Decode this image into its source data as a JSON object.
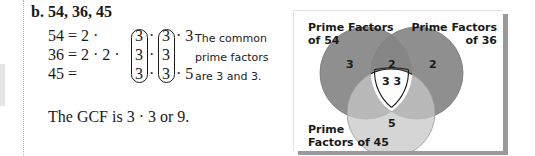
{
  "example": {
    "heading": "b. 54, 36, 45",
    "equations": [
      {
        "lhs": "54 = 2 ·",
        "factors": [
          "3",
          "3",
          "3"
        ],
        "tail": "· 3"
      },
      {
        "lhs": "36 = 2 · 2 ·",
        "factors": [
          "3",
          "3"
        ],
        "tail": ""
      },
      {
        "lhs": "45 =",
        "factors": [
          "3",
          "3"
        ],
        "tail": "· 5"
      }
    ],
    "dot": "·",
    "note_lines": [
      "The common",
      "prime factors",
      "are 3 and 3."
    ],
    "conclusion": "The GCF is 3 · 3 or 9."
  },
  "venn": {
    "labels": {
      "set_a_line1": "Prime Factors",
      "set_a_line2": "of 54",
      "set_b_line1": "Prime Factors",
      "set_b_line2": "of 36",
      "set_c_line1": "Prime",
      "set_c_line2": "Factors of 45"
    },
    "regions": {
      "a_only": "3",
      "b_only": "2",
      "a_and_b_only": "2",
      "all_three": "3 3",
      "c_only": "5"
    },
    "colors": {
      "circle_a": "#8f8f8f",
      "circle_b": "#8f8f8f",
      "circle_c": "#c7c7c7",
      "center": "#ffffff",
      "shadow": "#9a9a9a"
    }
  }
}
